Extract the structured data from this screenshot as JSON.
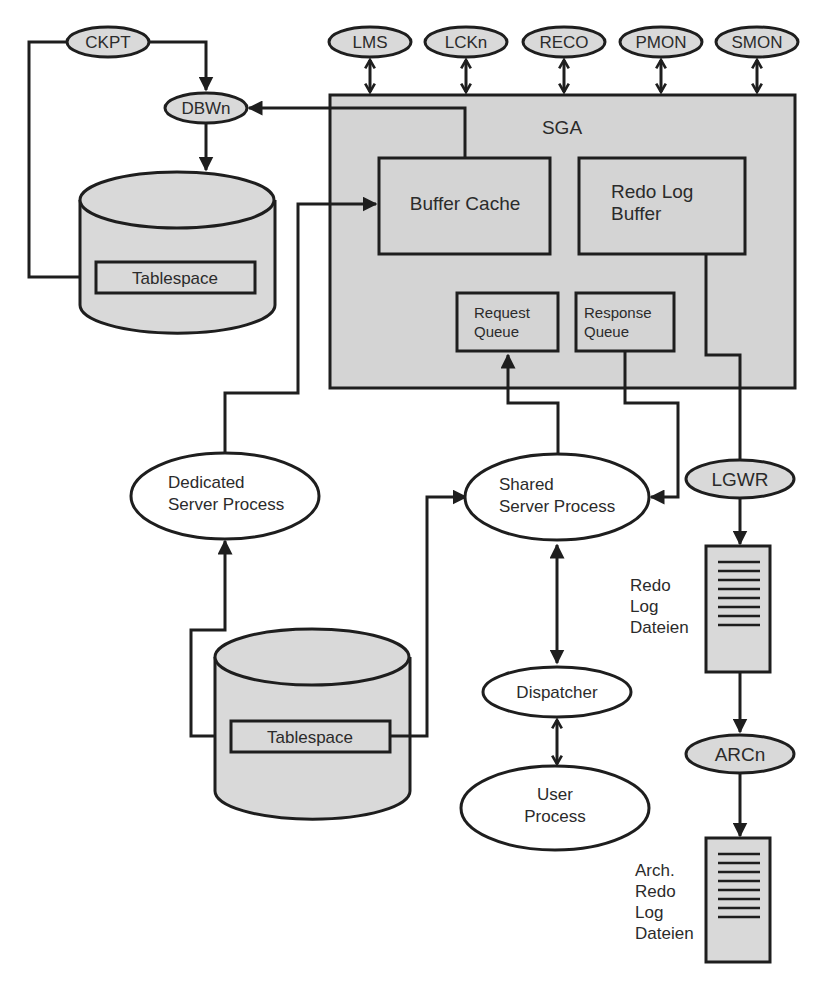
{
  "diagram": {
    "colors": {
      "line": "#1e1e1e",
      "fill_gray": "#d9d9d9",
      "sga_fill": "#d4d4d4",
      "background": "#ffffff",
      "text": "#2b2b2b"
    },
    "background_processes_top": [
      {
        "id": "lms",
        "label": "LMS"
      },
      {
        "id": "lckn",
        "label": "LCKn"
      },
      {
        "id": "reco",
        "label": "RECO"
      },
      {
        "id": "pmon",
        "label": "PMON"
      },
      {
        "id": "smon",
        "label": "SMON"
      }
    ],
    "ckpt": {
      "label": "CKPT"
    },
    "dbwn": {
      "label": "DBWn"
    },
    "lgwr": {
      "label": "LGWR"
    },
    "arcn": {
      "label": "ARCn"
    },
    "sga": {
      "label": "SGA",
      "buffer_cache": {
        "label": "Buffer Cache"
      },
      "redo_log_buffer": {
        "line1": "Redo Log",
        "line2": "Buffer"
      },
      "request_queue": {
        "line1": "Request",
        "line2": "Queue"
      },
      "response_queue": {
        "line1": "Response",
        "line2": "Queue"
      }
    },
    "datafile_top": {
      "tablespace_label": "Tablespace"
    },
    "datafile_bottom": {
      "tablespace_label": "Tablespace"
    },
    "dedicated_server": {
      "line1": "Dedicated",
      "line2": "Server Process"
    },
    "shared_server": {
      "line1": "Shared",
      "line2": "Server Process"
    },
    "dispatcher": {
      "label": "Dispatcher"
    },
    "user_process": {
      "line1": "User",
      "line2": "Process"
    },
    "redo_log_files": {
      "line1": "Redo",
      "line2": "Log",
      "line3": "Dateien"
    },
    "archived_redo_log_files": {
      "line1": "Arch.",
      "line2": "Redo",
      "line3": "Log",
      "line4": "Dateien"
    }
  }
}
